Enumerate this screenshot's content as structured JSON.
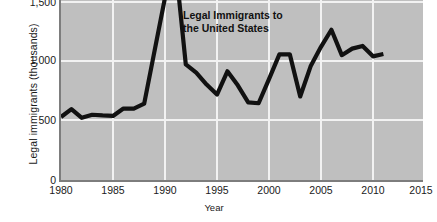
{
  "chart_data": {
    "type": "line",
    "title": "",
    "annotation": "Legal Immigrants to\nthe United States",
    "annotation_line1": "Legal Immigrants to",
    "annotation_line2": "the United States",
    "xlabel": "Year",
    "ylabel": "Legal immigrants (thousands)",
    "xlim": [
      1980,
      2015
    ],
    "ylim": [
      0,
      1550
    ],
    "grid": true,
    "legend": "none",
    "plot_background": "#bfbfbf",
    "line_color": "#111111",
    "gridline_color": "#f2f2f2",
    "axis_color": "#7d7d7d",
    "xticks": [
      1980,
      1985,
      1990,
      1995,
      2000,
      2005,
      2010,
      2015
    ],
    "xtick_labels": [
      "1980",
      "1985",
      "1990",
      "1995",
      "2000",
      "2005",
      "2010",
      "2015"
    ],
    "yticks": [
      0,
      500,
      1000,
      1500
    ],
    "ytick_labels": [
      "0",
      "500",
      "1,000",
      "1,500"
    ],
    "note": "Series peak near 1991 is clipped by the top edge of the figure",
    "x": [
      1980,
      1981,
      1982,
      1983,
      1984,
      1985,
      1986,
      1987,
      1988,
      1989,
      1990,
      1991,
      1992,
      1993,
      1994,
      1995,
      1996,
      1997,
      1998,
      1999,
      2000,
      2001,
      2002,
      2003,
      2004,
      2005,
      2006,
      2007,
      2008,
      2009,
      2010,
      2011
    ],
    "values": [
      531,
      597,
      524,
      550,
      544,
      540,
      602,
      602,
      643,
      1091,
      1536,
      1827,
      974,
      904,
      804,
      720,
      916,
      798,
      654,
      647,
      850,
      1059,
      1059,
      704,
      958,
      1122,
      1266,
      1052,
      1107,
      1130,
      1042,
      1062
    ]
  }
}
